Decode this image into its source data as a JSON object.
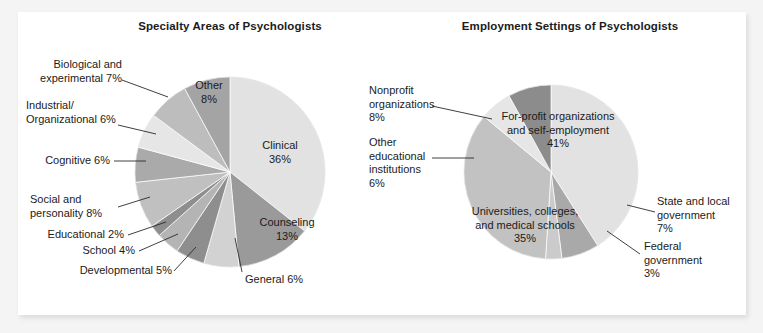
{
  "figure": {
    "background_color": "#f4f4f4",
    "card_color": "#ffffff"
  },
  "charts": [
    {
      "id": "specialty-areas",
      "title": "Specialty Areas of Psychologists"
    },
    {
      "id": "employment-settings",
      "title": "Employment Settings of Psychologists"
    }
  ],
  "labels": {
    "left": {
      "clinical": "Clinical\n36%",
      "counseling": "Counseling\n13%",
      "general": "General 6%",
      "developmental": "Developmental 5%",
      "school": "School 4%",
      "educational": "Educational 2%",
      "social": "Social and\npersonality 8%",
      "cognitive": "Cognitive 6%",
      "industrial": "Industrial/\nOrganizational 6%",
      "biological": "Biological and\nexperimental 7%",
      "other": "Other\n8%"
    },
    "right": {
      "forprofit": "For-profit organizations\nand self-employment\n41%",
      "state": "State and local\ngovernment\n7%",
      "federal": "Federal\ngovernment\n3%",
      "universities": "Universities, colleges,\nand medical schools\n35%",
      "othereduc": "Other\neducational\ninstitutions\n6%",
      "nonprofit": "Nonprofit\norganizations\n8%"
    }
  },
  "chart_data": [
    {
      "type": "pie",
      "title": "Specialty Areas of Psychologists",
      "xlabel": "",
      "ylabel": "",
      "legend": "none",
      "grid": false,
      "start_angle_deg": 0,
      "direction": "clockwise",
      "center_px": [
        230,
        172
      ],
      "radius_px": 95,
      "categories": [
        "Clinical",
        "Counseling",
        "General",
        "Developmental",
        "School",
        "Educational",
        "Social and personality",
        "Cognitive",
        "Industrial/Organizational",
        "Biological and experimental",
        "Other"
      ],
      "values": [
        36,
        13,
        6,
        5,
        4,
        2,
        8,
        6,
        6,
        7,
        8
      ],
      "units": "percent",
      "colors": [
        "#e2e2e2",
        "#9a9a9a",
        "#d2d2d2",
        "#8e8e8e",
        "#b4b4b4",
        "#8e8e8e",
        "#c0c0c0",
        "#aaaaaa",
        "#e6e6e6",
        "#bdbdbd",
        "#a4a4a4"
      ]
    },
    {
      "type": "pie",
      "title": "Employment Settings of Psychologists",
      "xlabel": "",
      "ylabel": "",
      "legend": "none",
      "grid": false,
      "start_angle_deg": 0,
      "direction": "clockwise",
      "center_px": [
        551,
        172
      ],
      "radius_px": 87,
      "categories": [
        "For-profit organizations and self-employment",
        "State and local government",
        "Federal government",
        "Universities, colleges, and medical schools",
        "Other educational institutions",
        "Nonprofit organizations"
      ],
      "values": [
        41,
        7,
        3,
        35,
        6,
        8
      ],
      "units": "percent",
      "colors": [
        "#e2e2e2",
        "#a9a9a9",
        "#cbcbcb",
        "#c2c2c2",
        "#e6e6e6",
        "#8c8c8c"
      ]
    }
  ]
}
